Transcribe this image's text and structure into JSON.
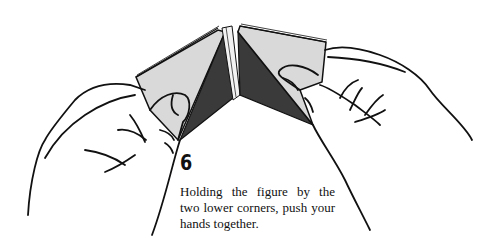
{
  "figure": {
    "step_number": "6",
    "caption_lines": [
      "Holding the figure by the",
      "two lower corners, push your",
      "hands together."
    ],
    "colors": {
      "paper_light": "#d9d9d9",
      "paper_dark": "#3a3a3a",
      "ink": "#111111",
      "background": "#ffffff"
    }
  }
}
